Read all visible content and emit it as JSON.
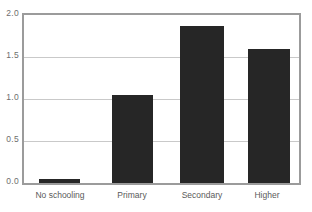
{
  "figure": {
    "top_bleed_text": "",
    "bar_color": "#262626",
    "frame_color": "#9b9b9b",
    "grid_color": "#c9c9c9",
    "tick_label_color": "#6e6e6e",
    "category_label_color": "#5a5a5a",
    "background": "#ffffff"
  },
  "chart_data": {
    "type": "bar",
    "title": "",
    "subtitle": "",
    "xlabel": "",
    "ylabel": "",
    "categories": [
      "No schooling",
      "Primary",
      "Secondary",
      "Higher"
    ],
    "values": [
      0.05,
      1.05,
      1.87,
      1.6
    ],
    "series": [
      {
        "name": "",
        "values": [
          0.05,
          1.05,
          1.87,
          1.6
        ]
      }
    ],
    "ylim": [
      0.0,
      2.0
    ],
    "yticks": [
      0.0,
      0.5,
      1.0,
      1.5,
      2.0
    ],
    "ytick_labels": [
      "0.0",
      "0.5",
      "1.0",
      "1.5",
      "2.0"
    ],
    "gridlines": {
      "horizontal": [
        0.5,
        1.0,
        1.5
      ],
      "vertical": []
    },
    "grid": true,
    "legend": null,
    "legend_position": "none",
    "annotations": []
  }
}
